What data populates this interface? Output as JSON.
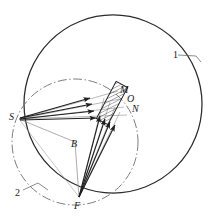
{
  "figure": {
    "name": "optical-ray-diagram",
    "background_color": "#ffffff",
    "stroke_color": "#262626",
    "thin_stroke_color": "#555555",
    "labels": {
      "source_point": "S",
      "center_point": "B",
      "focus_point": "F",
      "mirror_top": "M",
      "mirror_mid": "O",
      "mirror_bottom": "N",
      "callout_outer_circle": "1",
      "callout_inner_circle": "2"
    },
    "elements": [
      {
        "name": "outer-circle",
        "kind": "circle",
        "style": "solid",
        "cx": 113,
        "cy": 104,
        "r": 89
      },
      {
        "name": "inner-circle",
        "kind": "circle",
        "style": "dash-dot",
        "cx": 75,
        "cy": 142,
        "r": 63
      },
      {
        "name": "mirror-plate",
        "kind": "rectangle",
        "style": "hatched",
        "cx": 112,
        "cy": 103,
        "width": 13,
        "height": 42,
        "rotation_deg": 28
      },
      {
        "name": "incident-ray-bundle",
        "kind": "arrow-group",
        "from": "S",
        "to": "mirror-plate",
        "count": 4
      },
      {
        "name": "reflected-ray-bundle",
        "kind": "arrow-group",
        "from": "F",
        "to": "mirror-plate",
        "count": 4
      },
      {
        "name": "radius-line-BS",
        "kind": "line",
        "style": "thin",
        "from": "B",
        "to": "S"
      },
      {
        "name": "radius-line-BF",
        "kind": "line",
        "style": "thin",
        "from": "B",
        "to": "F"
      },
      {
        "name": "chord-line-SF",
        "kind": "line",
        "style": "thin",
        "from": "S",
        "to": "F"
      },
      {
        "name": "callout-leader-1",
        "kind": "leader-line",
        "label": "1"
      },
      {
        "name": "callout-leader-2",
        "kind": "leader-line",
        "label": "2"
      }
    ]
  }
}
